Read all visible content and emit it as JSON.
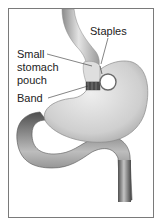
{
  "diagram": {
    "title": "",
    "labels": {
      "staples": "Staples",
      "pouch_line1": "Small",
      "pouch_line2": "stomach",
      "pouch_line3": "pouch",
      "band": "Band"
    },
    "colors": {
      "frame": "#7a7a7a",
      "organ_light": "#e6e6e6",
      "organ_mid": "#bdbdbd",
      "organ_dark": "#5a5a5a",
      "band": "#4a4a4a",
      "leader": "#333333"
    }
  }
}
